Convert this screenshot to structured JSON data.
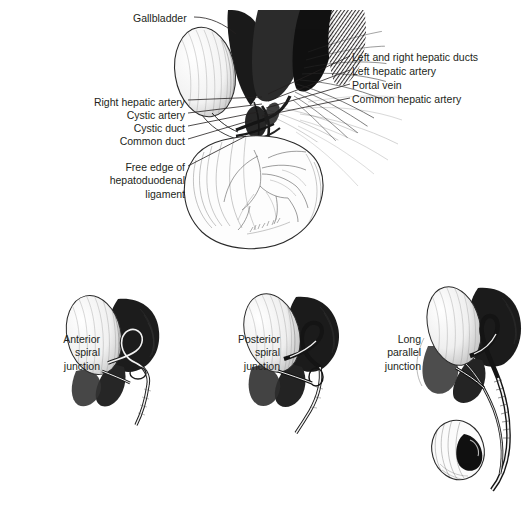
{
  "figure": {
    "type": "anatomical-illustration",
    "style": "black-and-white pen-and-ink engraving"
  },
  "top_panel": {
    "labels_left": [
      {
        "text": "Right hepatic artery",
        "x": 185,
        "y": 97
      },
      {
        "text": "Cystic artery",
        "x": 185,
        "y": 110
      },
      {
        "text": "Cystic duct",
        "x": 185,
        "y": 123
      },
      {
        "text": "Common duct",
        "x": 185,
        "y": 136
      }
    ],
    "label_top": {
      "text": "Gallbladder",
      "x": 133,
      "y": 12
    },
    "label_block_left": {
      "lines": [
        "Free edge of",
        "hepatoduodenal",
        "ligament"
      ],
      "x": 185,
      "y": 161
    },
    "labels_right": [
      {
        "text": "Left and right hepatic ducts",
        "x": 352,
        "y": 52
      },
      {
        "text": "Left hepatic artery",
        "x": 352,
        "y": 66
      },
      {
        "text": "Portal vein",
        "x": 352,
        "y": 80
      },
      {
        "text": "Common hepatic artery",
        "x": 352,
        "y": 94
      }
    ]
  },
  "bottom_panels": [
    {
      "lines": [
        "Anterior",
        "spiral",
        "junction"
      ],
      "x": 100,
      "y": 333
    },
    {
      "lines": [
        "Posterior",
        "spiral",
        "junction"
      ],
      "x": 280,
      "y": 333
    },
    {
      "lines": [
        "Long",
        "parallel",
        "junction"
      ],
      "x": 421,
      "y": 333
    }
  ],
  "colors": {
    "background": "#ffffff",
    "ink": "#231f20",
    "mid_tone": "#6d6d6d",
    "light_tone": "#c9c9c9"
  }
}
